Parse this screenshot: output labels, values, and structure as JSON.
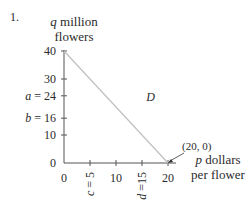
{
  "problem_number": "1.",
  "chart_data": {
    "type": "line",
    "title": "",
    "ylabel_line1": "q million",
    "ylabel_line2": "flowers",
    "xlabel_line1": "p dollars",
    "xlabel_line2": "per flower",
    "xlim": [
      0,
      20
    ],
    "ylim": [
      0,
      40
    ],
    "y_ticks": [
      {
        "value": 40,
        "label": "40"
      },
      {
        "value": 30,
        "label": "30"
      },
      {
        "value": 24,
        "label": "a = 24"
      },
      {
        "value": 16,
        "label": "b = 16"
      },
      {
        "value": 10,
        "label": "10"
      },
      {
        "value": 0,
        "label": "0"
      }
    ],
    "x_ticks": [
      {
        "value": 0,
        "label": "0",
        "rotated": false
      },
      {
        "value": 5,
        "label": "c = 5",
        "rotated": true
      },
      {
        "value": 10,
        "label": "10",
        "rotated": false
      },
      {
        "value": 15,
        "label": "d =15",
        "rotated": true
      },
      {
        "value": 20,
        "label": "20",
        "rotated": false
      }
    ],
    "series": [
      {
        "name": "D",
        "x": [
          0,
          20
        ],
        "y": [
          40,
          0
        ],
        "color": "#c0c0c0"
      }
    ],
    "annotations": [
      {
        "text": "D",
        "x": 15.8,
        "y": 22
      },
      {
        "text": "(20, 0)",
        "x": 20,
        "y": 0,
        "arrow": true
      }
    ],
    "grid": false,
    "legend": "none"
  }
}
